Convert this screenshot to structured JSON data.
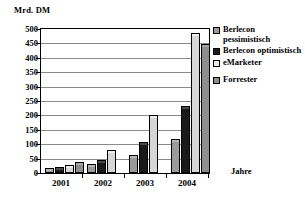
{
  "chart_data": {
    "type": "bar",
    "title": "",
    "xlabel": "Jahre",
    "ylabel": "Mrd. DM",
    "categories": [
      "2001",
      "2002",
      "2003",
      "2004"
    ],
    "ylim": [
      0,
      500
    ],
    "yticks": [
      500,
      450,
      400,
      350,
      300,
      250,
      200,
      150,
      100,
      50,
      0
    ],
    "grid": true,
    "legend_position": "right",
    "series": [
      {
        "name": "Berlecon pessimistisch",
        "color": "#9a9a9a",
        "values": [
          10,
          25,
          55,
          110
        ]
      },
      {
        "name": "Berlecon optimistisch",
        "color": "#1a1a1a",
        "values": [
          15,
          38,
          100,
          225
        ]
      },
      {
        "name": "eMarketer",
        "color": "#d6d6d6",
        "values": [
          20,
          72,
          195,
          480
        ]
      },
      {
        "name": "Forrester",
        "color": "#8e8e8e",
        "values": [
          30,
          null,
          null,
          440
        ]
      }
    ]
  },
  "axes": {
    "y_title": "Mrd. DM",
    "x_title": "Jahre"
  },
  "legend": {
    "items": [
      {
        "label": "Berlecon pessimistisch"
      },
      {
        "label": "Berlecon optimistisch"
      },
      {
        "label": "eMarketer"
      },
      {
        "label": "Forrester"
      }
    ]
  }
}
